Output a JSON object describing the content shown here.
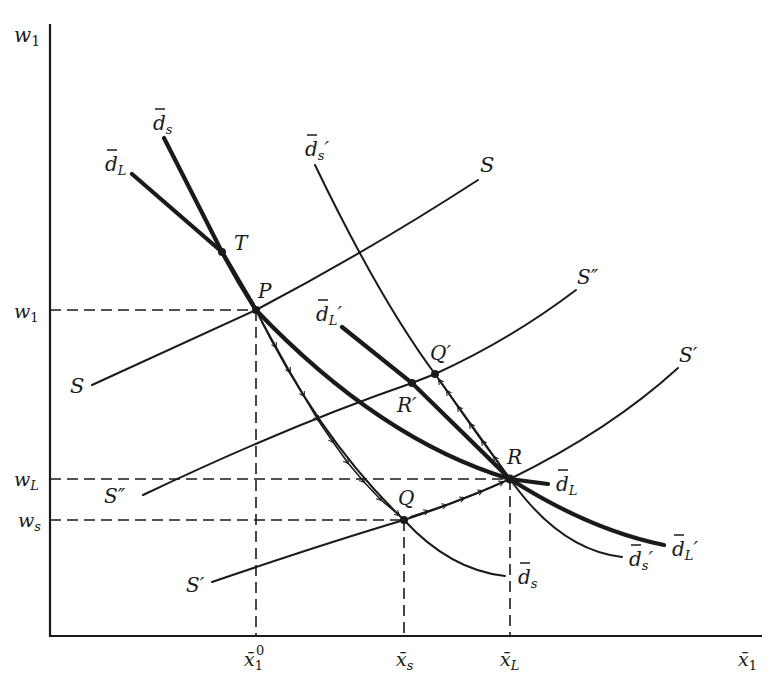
{
  "diagram": {
    "type": "economic supply-demand diagram",
    "axes": {
      "y_label": "w₁",
      "x_label": "x̄₁"
    },
    "y_ticks": [
      {
        "id": "w1",
        "label": "w₁",
        "main": "w",
        "sub": "1"
      },
      {
        "id": "wL",
        "label": "w_L",
        "main": "w",
        "sub": "L"
      },
      {
        "id": "ws",
        "label": "w_s",
        "main": "w",
        "sub": "s"
      }
    ],
    "x_ticks": [
      {
        "id": "x1_0",
        "label": "x̄₁⁰",
        "main": "x̄",
        "sub": "1",
        "sup": "0"
      },
      {
        "id": "xs",
        "label": "x̄_s",
        "main": "x̄",
        "sub": "s"
      },
      {
        "id": "xL",
        "label": "x̄_L",
        "main": "x̄",
        "sub": "L"
      }
    ],
    "curves": [
      {
        "id": "S",
        "label": "S",
        "weight": "thin",
        "description": "supply curve through P"
      },
      {
        "id": "S_dprime",
        "label": "S″",
        "weight": "thin",
        "description": "supply curve through R′ and Q′"
      },
      {
        "id": "S_prime",
        "label": "S′",
        "weight": "thin",
        "description": "supply curve through Q and R"
      },
      {
        "id": "dL",
        "label": "d̄_L",
        "weight": "thick",
        "description": "long-run demand through T, P, R"
      },
      {
        "id": "ds",
        "label": "d̄_s",
        "weight": "thick/thin",
        "description": "short-run demand through T, P, Q"
      },
      {
        "id": "dL_prime",
        "label": "d̄_L′",
        "weight": "thick",
        "description": "shifted long-run demand through R′ and R"
      },
      {
        "id": "ds_prime",
        "label": "d̄_s′",
        "weight": "thin",
        "description": "shifted short-run demand through Q′ and R"
      }
    ],
    "labels": {
      "S_left": "S",
      "S_right": "S",
      "S_dprime_left": "S″",
      "S_dprime_right": "S″",
      "S_prime_left": "S′",
      "S_prime_right": "S′",
      "dL_top": "d",
      "dL_top_sub": "L",
      "ds_top": "d",
      "ds_top_sub": "s",
      "ds_prime_top": "d",
      "ds_prime_top_sub": "s",
      "ds_prime_top_prime": "′",
      "dL_prime_top": "d",
      "dL_prime_top_sub": "L",
      "dL_prime_top_prime": "′",
      "dL_right": "d",
      "dL_right_sub": "L",
      "ds_bottom": "d",
      "ds_bottom_sub": "s",
      "ds_prime_bottom": "d",
      "ds_prime_bottom_sub": "s",
      "ds_prime_bottom_prime": "′",
      "dL_prime_bottom": "d",
      "dL_prime_bottom_sub": "L",
      "dL_prime_bottom_prime": "′"
    },
    "points": [
      {
        "id": "T",
        "label": "T"
      },
      {
        "id": "P",
        "label": "P"
      },
      {
        "id": "Q",
        "label": "Q"
      },
      {
        "id": "R",
        "label": "R"
      },
      {
        "id": "R_prime",
        "label": "R′"
      },
      {
        "id": "Q_prime",
        "label": "Q′"
      }
    ],
    "adjustment_paths": [
      {
        "from": "P",
        "to": "Q",
        "along": "d̄_s",
        "style": "arrowed"
      },
      {
        "from": "Q",
        "to": "R",
        "along": "S′",
        "style": "arrowed"
      },
      {
        "from": "R",
        "to": "Q′",
        "along": "d̄_s′",
        "style": "arrowed"
      }
    ]
  }
}
